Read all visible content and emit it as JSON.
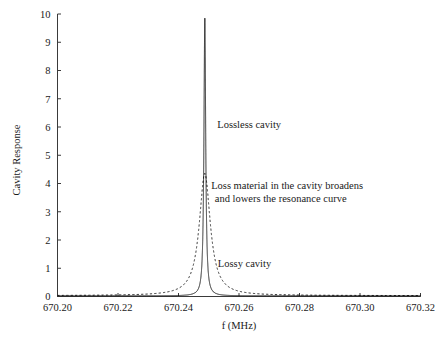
{
  "figure": {
    "width": 444,
    "height": 349,
    "background": "#ffffff",
    "ink_color": "#1a1a1a"
  },
  "chart_data": {
    "type": "line",
    "title": "",
    "xlabel": "f (MHz)",
    "ylabel": "Cavity Response",
    "xlim": [
      670.2,
      670.32
    ],
    "ylim": [
      0,
      10
    ],
    "xticks": [
      670.2,
      670.22,
      670.24,
      670.26,
      670.28,
      670.3,
      670.32
    ],
    "xtick_labels": [
      "670.20",
      "670.22",
      "670.24",
      "670.26",
      "670.28",
      "670.30",
      "670.32"
    ],
    "yticks": [
      0,
      1,
      2,
      3,
      4,
      5,
      6,
      7,
      8,
      9,
      10
    ],
    "ytick_labels": [
      "0",
      "1",
      "2",
      "3",
      "4",
      "5",
      "6",
      "7",
      "8",
      "9",
      "10"
    ],
    "grid": false,
    "legend": "none",
    "resonance_frequency_mhz": 670.2487,
    "series": [
      {
        "name": "Lossless cavity",
        "style": "solid",
        "peak_value": 9.85,
        "peak_x": 670.2487,
        "half_width_mhz": 0.00035,
        "baseline": 0.02,
        "description": "Very narrow high-Q Lorentzian resonance reaching the top of the axis"
      },
      {
        "name": "Lossy cavity",
        "style": "dashed",
        "peak_value": 4.35,
        "peak_x": 670.2487,
        "half_width_mhz": 0.0022,
        "baseline": 0.03,
        "description": "Broadened, lowered Lorentzian resonance with long shallow tails"
      }
    ],
    "annotations": [
      {
        "name": "lossless-cavity-label",
        "text": "Lossless cavity",
        "x": 670.2528,
        "y": 5.95
      },
      {
        "name": "loss-material-note-line1",
        "text": "Loss material in the cavity broadens",
        "x": 670.2508,
        "y": 3.8
      },
      {
        "name": "loss-material-note-line2",
        "text": "and lowers the resonance curve",
        "x": 670.252,
        "y": 3.36
      },
      {
        "name": "lossy-cavity-label",
        "text": "Lossy cavity",
        "x": 670.253,
        "y": 1.05
      }
    ]
  }
}
